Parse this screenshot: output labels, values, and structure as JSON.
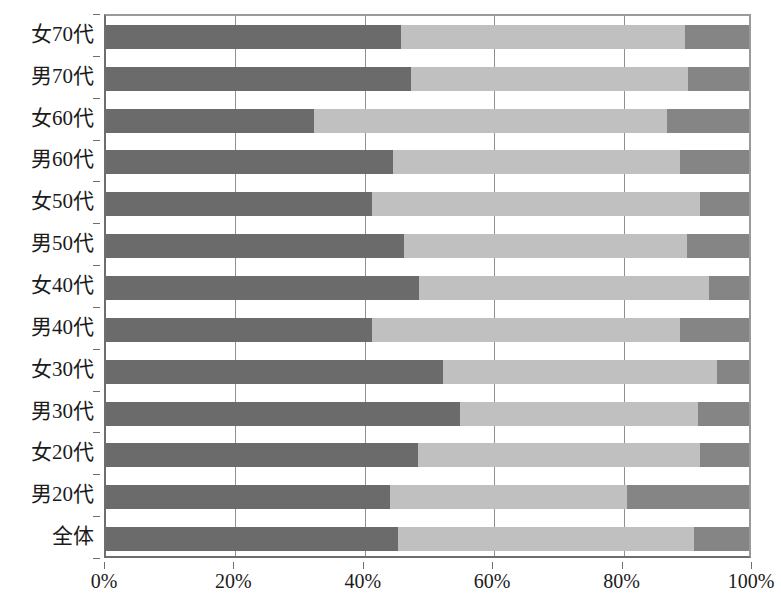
{
  "chart_data": {
    "type": "bar",
    "subtype": "stacked-horizontal-100-percent",
    "title": "",
    "xlabel": "",
    "ylabel": "",
    "xlim": [
      0,
      100
    ],
    "xticks": [
      0,
      20,
      40,
      60,
      80,
      100
    ],
    "xtick_labels": [
      "0%",
      "20%",
      "40%",
      "60%",
      "80%",
      "100%"
    ],
    "grid": true,
    "grid_axis": "x",
    "legend": null,
    "orientation": "horizontal",
    "categories": [
      "女70代",
      "男70代",
      "女60代",
      "男60代",
      "女50代",
      "男50代",
      "女40代",
      "男40代",
      "女30代",
      "男30代",
      "女20代",
      "男20代",
      "全体"
    ],
    "series": [
      {
        "name": "series-1",
        "color": "#6b6b6b",
        "values": [
          45.9,
          47.4,
          32.3,
          44.7,
          41.4,
          46.4,
          48.7,
          41.3,
          52.4,
          55.0,
          48.5,
          44.2,
          45.4
        ]
      },
      {
        "name": "series-2",
        "color": "#c0c0c0",
        "values": [
          44.2,
          43.1,
          54.9,
          44.5,
          51.0,
          44.0,
          45.0,
          48.0,
          42.6,
          37.0,
          43.9,
          36.8,
          46.1
        ]
      },
      {
        "name": "series-3",
        "color": "#858585",
        "values": [
          9.9,
          9.5,
          12.8,
          10.8,
          7.6,
          9.6,
          6.3,
          10.7,
          5.0,
          8.0,
          7.6,
          19.0,
          8.5
        ]
      }
    ],
    "colors": {
      "segment_1": "#6b6b6b",
      "segment_2": "#c0c0c0",
      "segment_3": "#858585",
      "axis": "#6e6e6e",
      "gridline": "#909090",
      "text": "#1b1b1b",
      "background": "#ffffff"
    }
  }
}
